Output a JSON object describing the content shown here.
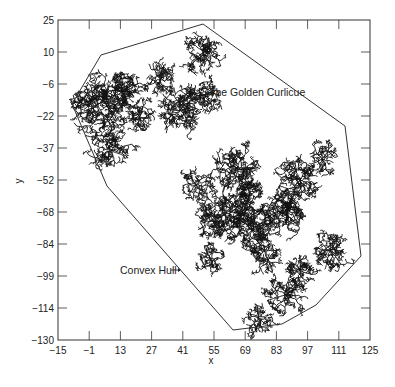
{
  "chart_data": {
    "type": "scatter",
    "title": "",
    "xlabel": "x",
    "ylabel": "y",
    "xlim": [
      -15,
      125
    ],
    "ylim": [
      -130,
      25
    ],
    "x_ticks": [
      "-15",
      "-1",
      "13",
      "27",
      "41",
      "55",
      "69",
      "83",
      "97",
      "111",
      "125"
    ],
    "y_ticks": [
      "25",
      "10",
      "-6",
      "-22",
      "-37",
      "-52",
      "-68",
      "-84",
      "-99",
      "-114",
      "-130"
    ],
    "grid": false,
    "legend": null,
    "series": [
      {
        "name": "The Golden Curlicue",
        "kind": "fractal point cloud (dense black scatter)",
        "approx_extent": {
          "x": [
            -12,
            120
          ],
          "y": [
            -128,
            24
          ]
        }
      },
      {
        "name": "Convex Hull",
        "kind": "polygon outline",
        "vertices": [
          [
            -8,
            -12
          ],
          [
            6,
            -7
          ],
          [
            46,
            23
          ],
          [
            115,
            -26
          ],
          [
            121,
            -89
          ],
          [
            104,
            -112
          ],
          [
            91,
            -121
          ],
          [
            68,
            -123
          ],
          [
            4,
            -54
          ]
        ]
      }
    ],
    "annotations": [
      {
        "text": "The Golden Curlicue",
        "x": 47,
        "y": -13
      },
      {
        "text": "Convex Hull",
        "x": 20,
        "y": -100,
        "arrow": "right"
      }
    ]
  },
  "labels": {
    "x_axis": "x",
    "y_axis": "y",
    "curlicue": "The Golden Curlicue",
    "hull": "Convex Hull"
  }
}
